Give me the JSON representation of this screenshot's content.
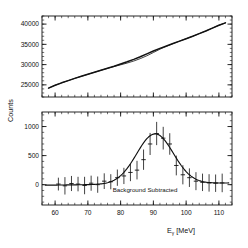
{
  "figure": {
    "background": "#ffffff",
    "ink": "#111111"
  },
  "chart_data": [
    {
      "type": "line",
      "panel": "top",
      "title": "",
      "xlabel": "",
      "ylabel": "Counts",
      "xlim": [
        56,
        114
      ],
      "ylim": [
        22000,
        42000
      ],
      "xticks": [
        60,
        70,
        80,
        90,
        100,
        110
      ],
      "xticklabels": [
        "",
        "",
        "",
        "",
        "",
        ""
      ],
      "yticks": [
        25000,
        30000,
        35000,
        40000
      ],
      "yticklabels": [
        "25000",
        "30000",
        "35000",
        "40000"
      ],
      "grid": false,
      "legend": "none",
      "series": [
        {
          "name": "data",
          "style": "line",
          "x": [
            58,
            60,
            62,
            64,
            66,
            68,
            70,
            72,
            74,
            76,
            78,
            80,
            82,
            84,
            86,
            88,
            90,
            92,
            94,
            96,
            98,
            100,
            102,
            104,
            106,
            108,
            110,
            112
          ],
          "values": [
            24200,
            24900,
            25500,
            26050,
            26600,
            27100,
            27600,
            28100,
            28600,
            29100,
            29600,
            30150,
            30700,
            31300,
            31950,
            32650,
            33350,
            34000,
            34600,
            35200,
            35800,
            36400,
            37000,
            37650,
            38300,
            39000,
            39700,
            40300
          ]
        },
        {
          "name": "background-fit",
          "style": "line",
          "x": [
            58,
            60,
            62,
            64,
            66,
            68,
            70,
            72,
            74,
            76,
            78,
            80,
            82,
            84,
            86,
            88,
            90,
            92,
            94,
            96,
            98,
            100,
            102,
            104,
            106,
            108,
            110,
            112
          ],
          "values": [
            24200,
            24900,
            25500,
            26050,
            26600,
            27100,
            27600,
            28100,
            28600,
            29080,
            29520,
            29940,
            30380,
            30880,
            31480,
            32180,
            32980,
            33800,
            34520,
            35180,
            35800,
            36400,
            37000,
            37650,
            38300,
            39000,
            39700,
            40300
          ]
        }
      ]
    },
    {
      "type": "scatter",
      "panel": "bottom",
      "title": "",
      "annotation": "Background Subtracted",
      "xlabel": "Eγ [MeV]",
      "xlabel_base": "E",
      "xlabel_sub": "γ",
      "xlabel_unit": "[MeV]",
      "ylabel": "Counts",
      "xlim": [
        56,
        114
      ],
      "ylim": [
        -350,
        1250
      ],
      "xticks": [
        60,
        70,
        80,
        90,
        100,
        110
      ],
      "xticklabels": [
        "60",
        "70",
        "80",
        "90",
        "100",
        "110"
      ],
      "yticks": [
        0,
        500,
        1000
      ],
      "yticklabels": [
        "0",
        "500",
        "1000"
      ],
      "grid": false,
      "legend": "none",
      "series": [
        {
          "name": "background-subtracted-counts",
          "style": "errorbar",
          "x": [
            61,
            63,
            65,
            67,
            69,
            71,
            73,
            75,
            77,
            79,
            81,
            83,
            85,
            87,
            89,
            91,
            93,
            95,
            97,
            99,
            101,
            103,
            105,
            107,
            109,
            111
          ],
          "values": [
            10,
            -20,
            20,
            10,
            -15,
            25,
            0,
            60,
            50,
            120,
            150,
            210,
            250,
            430,
            700,
            880,
            800,
            700,
            330,
            170,
            120,
            60,
            40,
            30,
            25,
            30
          ],
          "yerr": [
            110,
            150,
            130,
            125,
            150,
            130,
            140,
            135,
            130,
            140,
            140,
            150,
            160,
            175,
            190,
            200,
            195,
            185,
            170,
            165,
            160,
            155,
            150,
            150,
            150,
            160
          ]
        },
        {
          "name": "gaussian-fit",
          "style": "line",
          "peak_x": 90.5,
          "peak_y": 860,
          "sigma": 5.6,
          "baseline_left": -10,
          "baseline_right": 30
        }
      ]
    }
  ]
}
